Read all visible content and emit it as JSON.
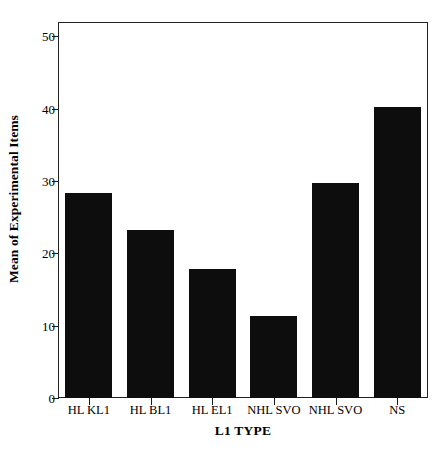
{
  "chart_data": {
    "type": "bar",
    "title": "",
    "subtitle": "",
    "xlabel": "L1 TYPE",
    "ylabel": "Mean of Experimental Items",
    "categories": [
      "HL KL1",
      "HL BL1",
      "HL EL1",
      "NHL SVO",
      "NHL SVO",
      "NS"
    ],
    "values": [
      28.4,
      23.3,
      17.9,
      11.4,
      29.8,
      40.3
    ],
    "ylim": [
      0,
      52
    ],
    "yticks": [
      0,
      10,
      20,
      30,
      40,
      50
    ],
    "ytick_labels": [
      "0",
      "10",
      "20",
      "30",
      "40",
      "50"
    ],
    "grid": false,
    "legend": false,
    "legend_position": "none",
    "bar_color": "#0d0d0d",
    "axis_color": "#222222",
    "background_color": "#ffffff"
  }
}
